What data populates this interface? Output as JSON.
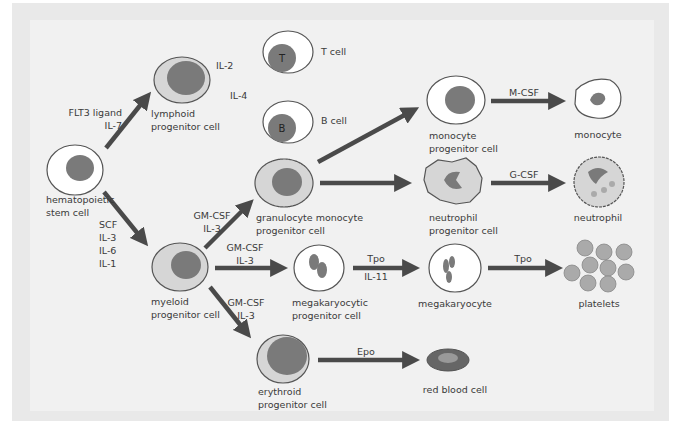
{
  "diagram": {
    "type": "hematopoiesis-flow",
    "colors": {
      "background": "#f1f1f1",
      "frame": "#e9e9e9",
      "arrow": "#4a4a4a",
      "nucleus": "#7a7a7a",
      "cytoplasm_light": "#d6d6d6",
      "cell_white": "#ffffff",
      "text": "#3a3a3a"
    },
    "cells": {
      "hsc": {
        "label_1": "hematopoietic",
        "label_2": "stem cell"
      },
      "lymphoid": {
        "label_1": "lymphoid",
        "label_2": "progenitor cell"
      },
      "t_cell": {
        "label": "T cell",
        "glyph": "T"
      },
      "b_cell": {
        "label": "B cell",
        "glyph": "B"
      },
      "myeloid": {
        "label_1": "myeloid",
        "label_2": "progenitor cell"
      },
      "gm_progenitor": {
        "label_1": "granulocyte monocyte",
        "label_2": "progenitor cell"
      },
      "monocyte_progenitor": {
        "label_1": "monocyte",
        "label_2": "progenitor cell"
      },
      "monocyte": {
        "label": "monocyte"
      },
      "neutrophil_progenitor": {
        "label_1": "neutrophil",
        "label_2": "progenitor cell"
      },
      "neutrophil": {
        "label": "neutrophil"
      },
      "mk_progenitor": {
        "label_1": "megakaryocytic",
        "label_2": "progenitor cell"
      },
      "megakaryocyte": {
        "label": "megakaryocyte"
      },
      "platelets": {
        "label": "platelets"
      },
      "erythroid": {
        "label_1": "erythroid",
        "label_2": "progenitor cell"
      },
      "rbc": {
        "label": "red blood cell"
      }
    },
    "factors": {
      "hsc_to_lymphoid": [
        "FLT3 ligand",
        "IL-7"
      ],
      "lymphoid_to_t": "IL-2",
      "lymphoid_to_b": "IL-4",
      "hsc_to_myeloid": [
        "SCF",
        "IL-3",
        "IL-6",
        "IL-1"
      ],
      "myeloid_to_gm": [
        "GM-CSF",
        "IL-3"
      ],
      "myeloid_to_mk": [
        "GM-CSF",
        "IL-3"
      ],
      "myeloid_to_ery": [
        "GM-CSF",
        "IL-3"
      ],
      "mono_prog_to_mono": "M-CSF",
      "neut_prog_to_neut": "G-CSF",
      "mk_prog_to_mk": [
        "Tpo",
        "IL-11"
      ],
      "mk_to_platelets": "Tpo",
      "ery_to_rbc": "Epo"
    }
  }
}
